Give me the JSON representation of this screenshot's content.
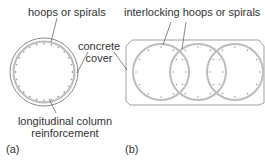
{
  "figure_a": {
    "label": "(a)",
    "hoops_label": "hoops or spirals",
    "cover_label_line1": "concrete",
    "cover_label_line2": "cover",
    "reinforcement_label_line1": "longitudinal column",
    "reinforcement_label_line2": "reinforcement"
  },
  "figure_b": {
    "label": "(b)",
    "hoops_label": "interlocking hoops or spirals"
  },
  "colors": {
    "outline": "#8a8a8a",
    "hoop": "#b5b5b5",
    "bar": "#9a9a9a",
    "leader": "#555555"
  }
}
